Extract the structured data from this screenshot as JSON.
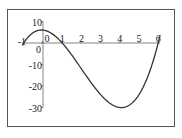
{
  "chart_data": {
    "type": "line",
    "title": "",
    "xlabel": "",
    "ylabel": "",
    "function": "y = (x+1)(x-1)(x-6)",
    "xlim": [
      -1,
      6.1
    ],
    "ylim": [
      -30,
      10
    ],
    "x_ticks": [
      "-1",
      "0",
      "1",
      "2",
      "3",
      "4",
      "5",
      "6"
    ],
    "y_ticks": [
      "10",
      "0",
      "-10",
      "-20",
      "-30"
    ],
    "grid": false,
    "legend": null,
    "series": [
      {
        "name": "curve",
        "x": [
          -1,
          -0.5,
          0,
          0.5,
          1,
          1.5,
          2,
          2.5,
          3,
          3.5,
          4,
          4.5,
          5,
          5.5,
          6,
          6.1
        ],
        "y": [
          0,
          4.875,
          6,
          4.125,
          0,
          -5.625,
          -12,
          -18.375,
          -24,
          -28.125,
          -30,
          -28.875,
          -24,
          -14.625,
          0,
          2.7
        ]
      }
    ],
    "color": "#333333"
  }
}
